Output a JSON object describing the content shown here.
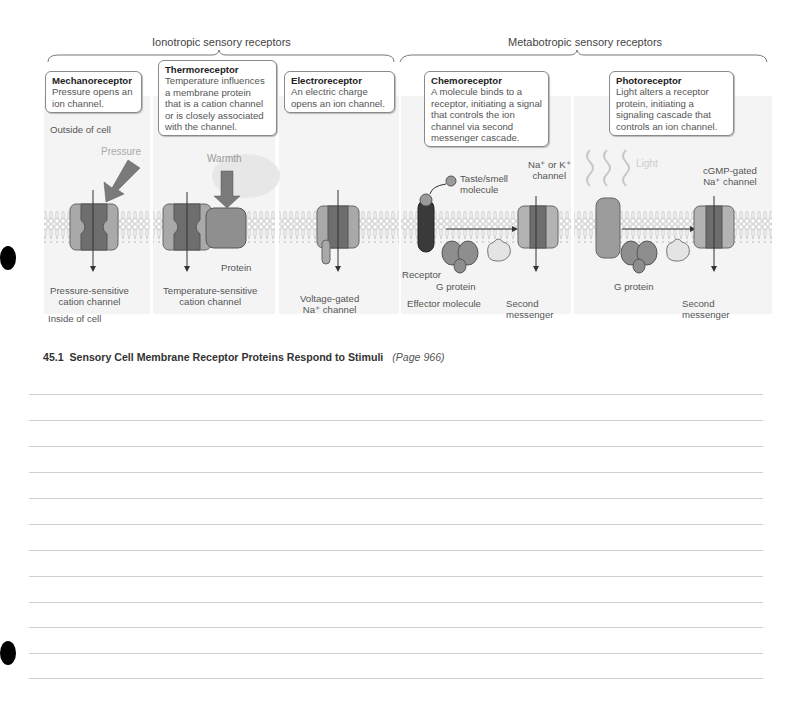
{
  "figure": {
    "groups": [
      {
        "label": "Ionotropic sensory receptors"
      },
      {
        "label": "Metabotropic sensory receptors"
      }
    ],
    "callouts": [
      {
        "title": "Mechanoreceptor",
        "body": [
          "Pressure opens an",
          "ion channel."
        ]
      },
      {
        "title": "Thermoreceptor",
        "body": [
          "Temperature influences",
          "a membrane protein",
          "that is a cation channel",
          "or is closely associated",
          "with the channel."
        ]
      },
      {
        "title": "Electroreceptor",
        "body": [
          "An electric charge",
          "opens an ion channel."
        ]
      },
      {
        "title": "Chemoreceptor",
        "body": [
          "A molecule binds to a",
          "receptor, initiating a signal",
          "that controls the ion",
          "channel via second",
          "messenger cascade."
        ]
      },
      {
        "title": "Photoreceptor",
        "body": [
          "Light alters a receptor",
          "protein, initiating a",
          "signaling cascade that",
          "controls an ion channel."
        ]
      }
    ],
    "side_labels": {
      "outside": "Outside of cell",
      "inside": "Inside of cell"
    },
    "stimuli": {
      "pressure": "Pressure",
      "warmth": "Warmth",
      "light": "Light"
    },
    "labels": {
      "pressure_channel": [
        "Pressure-sensitive",
        "cation channel"
      ],
      "temperature_channel": [
        "Temperature-sensitive",
        "cation channel"
      ],
      "protein": "Protein",
      "voltage_channel": [
        "Voltage-gated",
        "Na⁺ channel"
      ],
      "taste_smell": [
        "Taste/smell",
        "molecule"
      ],
      "na_k_channel": [
        "Na⁺ or K⁺",
        "channel"
      ],
      "receptor": "Receptor",
      "g_protein_1": "G protein",
      "effector": "Effector molecule",
      "second_messenger_1": [
        "Second",
        "messenger"
      ],
      "g_protein_2": "G protein",
      "cgmp_channel": [
        "cGMP-gated",
        "Na⁺ channel"
      ],
      "second_messenger_2": [
        "Second",
        "messenger"
      ]
    }
  },
  "caption": {
    "number": "45.1",
    "title": "Sensory Cell Membrane Receptor Proteins Respond to Stimuli",
    "page_ref": "(Page 966)"
  },
  "notes": {
    "line_count": 12
  }
}
